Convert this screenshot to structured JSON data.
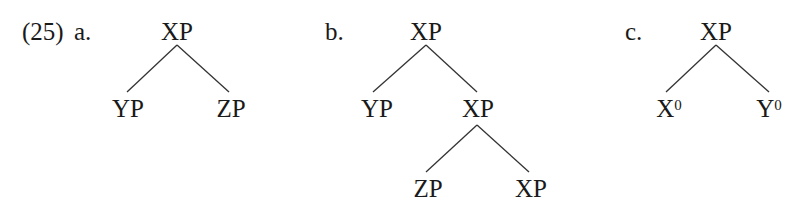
{
  "example_number": "(25)",
  "trees": [
    {
      "label": "a.",
      "root": "XP",
      "children": [
        "YP",
        "ZP"
      ]
    },
    {
      "label": "b.",
      "root": "XP",
      "children": [
        "YP",
        "XP"
      ],
      "subtree": {
        "root": "XP",
        "children": [
          "ZP",
          "XP"
        ]
      }
    },
    {
      "label": "c.",
      "root": "XP",
      "children": [
        {
          "base": "X",
          "sup": "0"
        },
        {
          "base": "Y",
          "sup": "0"
        }
      ]
    }
  ]
}
